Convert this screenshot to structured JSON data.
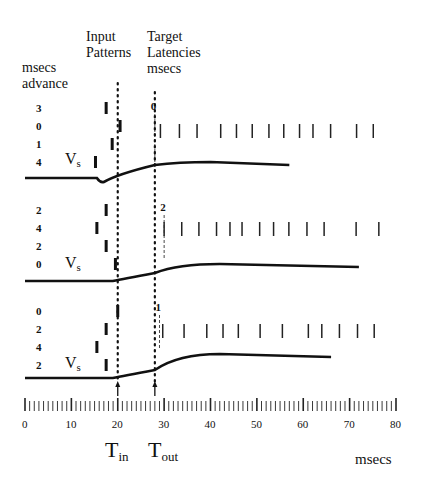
{
  "header": {
    "col1": [
      "msecs",
      "advance"
    ],
    "col2": [
      "Input",
      "Patterns"
    ],
    "col3": [
      "Target",
      "Latencies",
      "msecs"
    ]
  },
  "vs_label": "V",
  "vs_sub": "s",
  "panels": [
    {
      "advances": [
        "3",
        "0",
        "1",
        "4"
      ],
      "target_latency": "0",
      "input_bars_ms": [
        17.5,
        20.5,
        18.8,
        15.2
      ],
      "spikes_ms": [
        29.2,
        33.3,
        37.1,
        42.2,
        45.6,
        49.0,
        52.6,
        55.8,
        59.2,
        62.1,
        65.9,
        71.5,
        75.1
      ]
    },
    {
      "advances": [
        "2",
        "4",
        "2",
        "0"
      ],
      "target_latency": "2",
      "input_bars_ms": [
        17.5,
        15.5,
        17.5,
        19.5
      ],
      "spikes_ms": [
        30.0,
        33.8,
        37.5,
        41.3,
        44.2,
        46.8,
        50.6,
        53.6,
        56.9,
        60.8,
        64.5,
        71.4,
        76.3
      ]
    },
    {
      "advances": [
        "0",
        "2",
        "4",
        "2"
      ],
      "target_latency": "1",
      "input_bars_ms": [
        20.0,
        17.5,
        15.5,
        17.5
      ],
      "spikes_ms": [
        29.7,
        34.3,
        39.2,
        42.7,
        46.0,
        50.7,
        55.5,
        61.1,
        64.0,
        67.8,
        71.7,
        75.3
      ]
    }
  ],
  "axis": {
    "tick_labels": [
      "0",
      "10",
      "20",
      "30",
      "40",
      "50",
      "60",
      "70",
      "80"
    ],
    "unit": "msecs",
    "t_in": "T",
    "t_in_sub": "in",
    "t_out": "T",
    "t_out_sub": "out",
    "t_in_ms": 20,
    "t_out_ms": 28
  },
  "chart_data": {
    "type": "line",
    "title": "",
    "xlabel": "msecs",
    "ylabel": "",
    "xlim": [
      0,
      80
    ],
    "x_ticks": [
      0,
      10,
      20,
      30,
      40,
      50,
      60,
      70,
      80
    ],
    "annotations": [
      "Input Patterns",
      "Target Latencies msecs",
      "msecs advance",
      "Vs",
      "Tin",
      "Tout"
    ],
    "markers": {
      "T_in": 20,
      "T_out": 28
    },
    "series": [
      {
        "name": "Panel 1 Vs",
        "advances": [
          3,
          0,
          1,
          4
        ],
        "target_latency_ms": 0
      },
      {
        "name": "Panel 2 Vs",
        "advances": [
          2,
          4,
          2,
          0
        ],
        "target_latency_ms": 2
      },
      {
        "name": "Panel 3 Vs",
        "advances": [
          0,
          2,
          4,
          2
        ],
        "target_latency_ms": 1
      }
    ]
  }
}
